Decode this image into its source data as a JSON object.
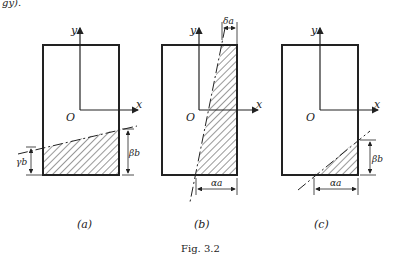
{
  "top_fragment": "gy).",
  "panels": [
    {
      "id": "a",
      "caption": "(a)",
      "axis_y": "y",
      "axis_x": "x",
      "origin": "O",
      "dims": {
        "left": "γb",
        "right": "βb"
      }
    },
    {
      "id": "b",
      "caption": "(b)",
      "axis_y": "y",
      "axis_x": "x",
      "origin": "O",
      "dims": {
        "top": "δa",
        "bottom": "αa"
      }
    },
    {
      "id": "c",
      "caption": "(c)",
      "axis_y": "y",
      "axis_x": "x",
      "origin": "O",
      "dims": {
        "right": "βb",
        "bottom": "αa"
      }
    }
  ],
  "figure_caption": "Fig. 3.2",
  "colors": {
    "ink": "#222222",
    "background": "#ffffff"
  }
}
